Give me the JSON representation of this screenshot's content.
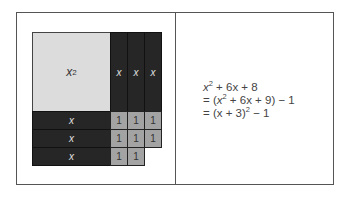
{
  "diagram": {
    "square": {
      "label": "x",
      "exp": "2"
    },
    "columns": [
      "x",
      "x",
      "x"
    ],
    "rows": [
      "x",
      "x",
      "x"
    ],
    "unit_label": "1",
    "unit_rows": [
      3,
      3,
      2
    ]
  },
  "equation": {
    "line1": {
      "a": "x",
      "a_exp": "2",
      "rest": " + 6x + 8"
    },
    "line2": {
      "pre": "= (",
      "a": "x",
      "a_exp": "2",
      "rest": " + 6x + 9) − 1"
    },
    "line3": {
      "pre": "= (x + 3)",
      "exp": "2",
      "rest": " − 1"
    }
  }
}
